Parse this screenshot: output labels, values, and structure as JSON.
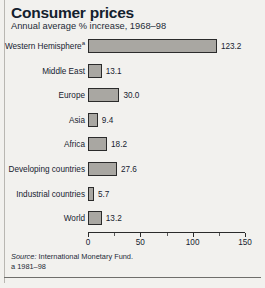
{
  "header": {
    "title": "Consumer prices",
    "subtitle": "Annual average % increase, 1968–98"
  },
  "footer": {
    "source_prefix": "Source:",
    "source_text": "International Monetary Fund.",
    "note": "a  1981–98"
  },
  "chart_data": {
    "type": "bar",
    "orientation": "horizontal",
    "title": "Consumer prices",
    "subtitle": "Annual average % increase, 1968–98",
    "xlabel": "",
    "ylabel": "",
    "xlim": [
      0,
      150
    ],
    "xticks": [
      0,
      50,
      100,
      150
    ],
    "xtick_labels": [
      "0",
      "50",
      "100",
      "150"
    ],
    "minor_xticks": [
      25,
      75,
      125
    ],
    "grid": false,
    "legend": false,
    "bar_color": "#a9a7a2",
    "bar_edge_color": "#2b2b2b",
    "categories": [
      "Western Hemisphere",
      "Middle East",
      "Europe",
      "Asia",
      "Africa",
      "Developing countries",
      "Industrial countries",
      "World"
    ],
    "category_footnotes": [
      "a",
      "",
      "",
      "",
      "",
      "",
      "",
      ""
    ],
    "values": [
      123.2,
      13.1,
      30.0,
      9.4,
      18.2,
      27.6,
      5.7,
      13.2
    ],
    "value_labels": [
      "123.2",
      "13.1",
      "30.0",
      "9.4",
      "18.2",
      "27.6",
      "5.7",
      "13.2"
    ]
  }
}
